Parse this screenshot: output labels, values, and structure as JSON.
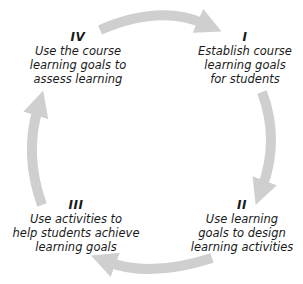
{
  "diagram": {
    "type": "cycle",
    "arrow_color": "#cfcfcf",
    "steps": [
      {
        "numeral": "I",
        "lines": [
          "Establish course",
          "learning goals",
          "for students"
        ]
      },
      {
        "numeral": "II",
        "lines": [
          "Use learning",
          "goals to design",
          "learning activities"
        ]
      },
      {
        "numeral": "III",
        "lines": [
          "Use activities to",
          "help students achieve",
          "learning goals"
        ]
      },
      {
        "numeral": "IV",
        "lines": [
          "Use the course",
          "learning goals to",
          "assess learning"
        ]
      }
    ]
  }
}
